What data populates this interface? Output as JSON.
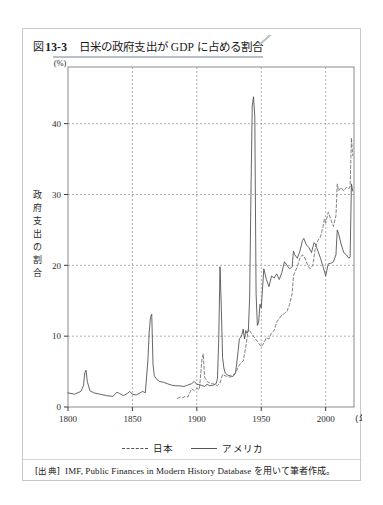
{
  "figure": {
    "number_glyph": "図",
    "number": "13-3",
    "title": "日米の政府支出が GDP に占める割合"
  },
  "legend": {
    "position": "below-axis",
    "entries": [
      {
        "label": "日本",
        "style": "dashed"
      },
      {
        "label": "アメリカ",
        "style": "solid"
      }
    ]
  },
  "source": {
    "label": "[出典]",
    "text": "IMF, Public Finances in Modern History Database を用いて筆者作成。"
  },
  "chart_data": {
    "type": "line",
    "title": "日米の政府支出が GDP に占める割合",
    "xlabel": "(年)",
    "ylabel": "政府支出の割合",
    "yunit": "(%)",
    "xlim": [
      1800,
      2022
    ],
    "ylim": [
      0,
      48
    ],
    "xticks": [
      1800,
      1850,
      1900,
      1950,
      2000
    ],
    "xticklabels": [
      "1800",
      "1850",
      "1900",
      "1950",
      "2000"
    ],
    "yticks": [
      0,
      10,
      20,
      30,
      40
    ],
    "yticklabels": [
      "0",
      "10",
      "20",
      "30",
      "40"
    ],
    "grid": true,
    "grid_style": "dotted",
    "series": [
      {
        "name": "アメリカ",
        "style": "solid",
        "color": "#4a4a4a",
        "x": [
          1800,
          1805,
          1810,
          1812,
          1813,
          1814,
          1815,
          1817,
          1820,
          1825,
          1830,
          1835,
          1838,
          1840,
          1843,
          1846,
          1848,
          1850,
          1853,
          1856,
          1858,
          1860,
          1862,
          1863,
          1864,
          1865,
          1866,
          1867,
          1869,
          1871,
          1874,
          1877,
          1880,
          1883,
          1886,
          1890,
          1893,
          1896,
          1898,
          1900,
          1903,
          1906,
          1908,
          1910,
          1913,
          1915,
          1916,
          1917,
          1918,
          1919,
          1920,
          1921,
          1922,
          1924,
          1926,
          1928,
          1930,
          1931,
          1932,
          1933,
          1934,
          1935,
          1936,
          1937,
          1938,
          1939,
          1940,
          1941,
          1942,
          1943,
          1944,
          1945,
          1946,
          1947,
          1948,
          1949,
          1950,
          1952,
          1954,
          1956,
          1958,
          1960,
          1962,
          1964,
          1966,
          1968,
          1970,
          1972,
          1974,
          1975,
          1976,
          1978,
          1980,
          1982,
          1983,
          1985,
          1987,
          1989,
          1991,
          1992,
          1994,
          1996,
          1998,
          2000,
          2002,
          2004,
          2006,
          2008,
          2009,
          2010,
          2012,
          2014,
          2016,
          2018,
          2019,
          2020,
          2021
        ],
        "y": [
          2.0,
          1.8,
          2.2,
          3.0,
          4.8,
          5.2,
          3.6,
          2.3,
          2.0,
          1.8,
          1.6,
          1.5,
          2.1,
          1.9,
          1.6,
          1.9,
          2.2,
          1.8,
          1.7,
          2.0,
          2.2,
          2.0,
          6.5,
          10.5,
          12.6,
          13.1,
          6.0,
          4.4,
          3.9,
          3.6,
          3.5,
          3.3,
          3.1,
          3.0,
          3.0,
          2.9,
          3.1,
          3.3,
          3.6,
          3.2,
          3.1,
          2.9,
          3.2,
          3.0,
          3.1,
          3.3,
          4.0,
          9.5,
          19.8,
          14.0,
          7.0,
          5.5,
          4.8,
          4.5,
          4.4,
          4.3,
          4.8,
          6.2,
          7.8,
          9.6,
          9.8,
          10.2,
          11.0,
          9.6,
          10.8,
          10.4,
          10.8,
          15.5,
          30.0,
          42.5,
          43.8,
          41.0,
          16.0,
          11.5,
          12.0,
          14.5,
          14.0,
          19.5,
          18.0,
          17.0,
          18.5,
          18.2,
          18.8,
          18.0,
          19.0,
          20.5,
          20.0,
          19.5,
          19.8,
          22.0,
          21.5,
          21.0,
          22.0,
          23.5,
          23.8,
          22.9,
          22.5,
          21.8,
          23.2,
          23.0,
          22.0,
          21.0,
          19.8,
          18.5,
          20.2,
          20.3,
          20.5,
          21.5,
          25.0,
          24.5,
          23.0,
          21.8,
          21.5,
          21.0,
          21.2,
          31.5,
          30.5
        ]
      },
      {
        "name": "日本",
        "style": "dashed",
        "color": "#6b6b6b",
        "x": [
          1885,
          1887,
          1889,
          1891,
          1893,
          1895,
          1896,
          1898,
          1900,
          1902,
          1904,
          1905,
          1906,
          1908,
          1910,
          1912,
          1914,
          1916,
          1918,
          1920,
          1922,
          1924,
          1926,
          1928,
          1930,
          1932,
          1934,
          1936,
          1938,
          1940,
          1950,
          1952,
          1954,
          1956,
          1958,
          1960,
          1962,
          1964,
          1966,
          1968,
          1970,
          1972,
          1974,
          1975,
          1976,
          1978,
          1980,
          1982,
          1984,
          1986,
          1988,
          1990,
          1992,
          1994,
          1996,
          1998,
          1999,
          2000,
          2002,
          2004,
          2006,
          2008,
          2009,
          2010,
          2012,
          2014,
          2016,
          2018,
          2019,
          2020,
          2021
        ],
        "y": [
          1.2,
          1.4,
          1.3,
          1.5,
          1.4,
          2.2,
          2.6,
          2.3,
          2.6,
          2.5,
          6.8,
          7.5,
          4.2,
          3.6,
          3.4,
          3.3,
          3.2,
          3.0,
          3.4,
          4.6,
          4.4,
          4.3,
          4.2,
          4.5,
          4.8,
          5.6,
          6.2,
          6.5,
          8.5,
          11.0,
          8.5,
          9.0,
          9.8,
          9.6,
          10.5,
          10.8,
          12.0,
          12.5,
          13.0,
          13.2,
          13.5,
          14.5,
          16.0,
          18.5,
          19.0,
          19.8,
          21.0,
          21.5,
          21.0,
          20.0,
          19.5,
          20.0,
          22.5,
          23.5,
          24.0,
          25.5,
          26.5,
          26.0,
          27.5,
          26.5,
          25.5,
          27.0,
          31.5,
          30.5,
          31.0,
          30.5,
          31.0,
          30.8,
          31.2,
          38.0,
          35.5
        ]
      }
    ],
    "annotations": [
      {
        "text": "War of 1812 peak",
        "year": 1814,
        "value": 5.2,
        "series": "アメリカ"
      },
      {
        "text": "Civil War peak",
        "year": 1865,
        "value": 13.1,
        "series": "アメリカ"
      },
      {
        "text": "World War I peak",
        "year": 1918,
        "value": 19.8,
        "series": "アメリカ"
      },
      {
        "text": "World War II peak",
        "year": 1944,
        "value": 43.8,
        "series": "アメリカ"
      },
      {
        "text": "COVID-19 peak",
        "year": 2020,
        "value": 31.5,
        "series": "アメリカ"
      }
    ]
  }
}
